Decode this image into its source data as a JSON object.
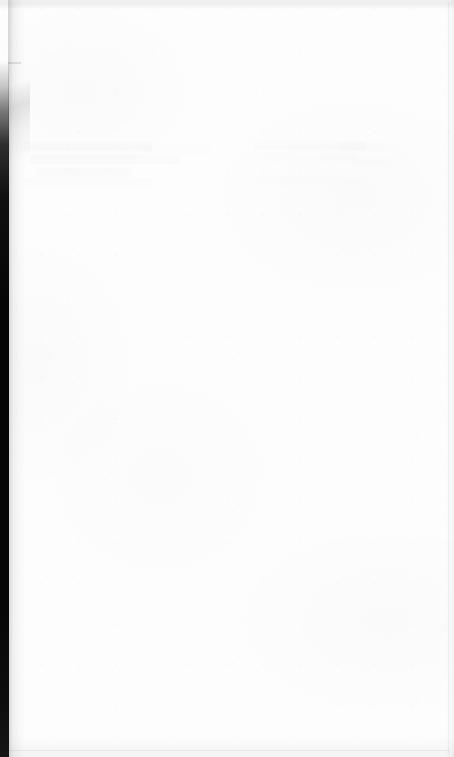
{
  "document": {
    "kind": "scanned-page",
    "content_state": "blank",
    "page_text": "",
    "visible_text_note": "No legible text is rendered on this page.",
    "width_px": 454,
    "height_px": 757
  },
  "colors": {
    "paper": "#fdfdfd",
    "gutter_shadow": "#060606",
    "top_edge_band": "#eeeeee",
    "bottom_edge_band": "#f3f3f3",
    "hairline": "#f0f0f0"
  },
  "regions": {
    "gutter": {
      "name": "left-binding-gutter",
      "description": "dark vertical scan shadow along the left edge",
      "width_px": 9
    },
    "top_band": {
      "name": "top-page-edge",
      "description": "light gray band across the top of the scan",
      "height_px": 9
    },
    "bottom_band": {
      "name": "bottom-page-edge",
      "description": "light gray band across the bottom of the scan",
      "height_px": 22
    },
    "ghost_text": {
      "name": "show-through-ghosting",
      "description": "extremely faint illegible bleed-through from the reverse side of the sheet",
      "legible": false
    }
  }
}
